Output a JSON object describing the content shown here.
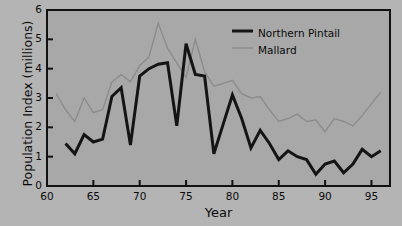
{
  "chart_data": {
    "type": "line",
    "title": "",
    "xlabel": "Year",
    "ylabel": "Population Index (millions)",
    "xlim": [
      60,
      97
    ],
    "ylim": [
      0,
      6
    ],
    "xticks": [
      60,
      65,
      70,
      75,
      80,
      85,
      90,
      95
    ],
    "yticks": [
      0,
      1,
      2,
      3,
      4,
      5,
      6
    ],
    "grid": false,
    "legend_position": "top-right",
    "plot_background": "#a8a8a8",
    "figure_background": "#b4b4b4",
    "series": [
      {
        "name": "Northern Pintail",
        "color": "#141414",
        "width": 3.0,
        "x": [
          62,
          63,
          64,
          65,
          66,
          67,
          68,
          69,
          70,
          71,
          72,
          73,
          74,
          75,
          76,
          77,
          78,
          79,
          80,
          81,
          82,
          83,
          84,
          85,
          86,
          87,
          88,
          89,
          90,
          91,
          92,
          93,
          94,
          95,
          96
        ],
        "values": [
          1.45,
          1.1,
          1.75,
          1.5,
          1.6,
          3.05,
          3.35,
          1.4,
          3.75,
          4.0,
          4.15,
          4.2,
          2.05,
          4.85,
          3.8,
          3.75,
          1.1,
          2.1,
          3.1,
          2.3,
          1.3,
          1.9,
          1.45,
          0.9,
          1.2,
          1.0,
          0.9,
          0.4,
          0.75,
          0.85,
          0.45,
          0.75,
          1.25,
          1.0,
          1.2
        ]
      },
      {
        "name": "Mallard",
        "color": "#8c8c8c",
        "width": 1.4,
        "x": [
          61,
          62,
          63,
          64,
          65,
          66,
          67,
          68,
          69,
          70,
          71,
          72,
          73,
          74,
          75,
          76,
          77,
          78,
          79,
          80,
          81,
          82,
          83,
          84,
          85,
          86,
          87,
          88,
          89,
          90,
          91,
          92,
          93,
          94,
          95,
          96
        ],
        "values": [
          3.15,
          2.6,
          2.2,
          3.0,
          2.5,
          2.6,
          3.55,
          3.8,
          3.55,
          4.1,
          4.4,
          5.55,
          4.7,
          4.2,
          3.7,
          5.0,
          3.9,
          3.4,
          3.5,
          3.6,
          3.15,
          3.0,
          3.05,
          2.6,
          2.2,
          2.3,
          2.45,
          2.2,
          2.25,
          1.85,
          2.3,
          2.2,
          2.05,
          2.4,
          2.8,
          3.2
        ]
      }
    ]
  },
  "legend": {
    "items": [
      {
        "label": "Northern Pintail"
      },
      {
        "label": "Mallard"
      }
    ]
  },
  "axis_labels": {
    "y": "Population Index (millions)",
    "x": "Year"
  }
}
